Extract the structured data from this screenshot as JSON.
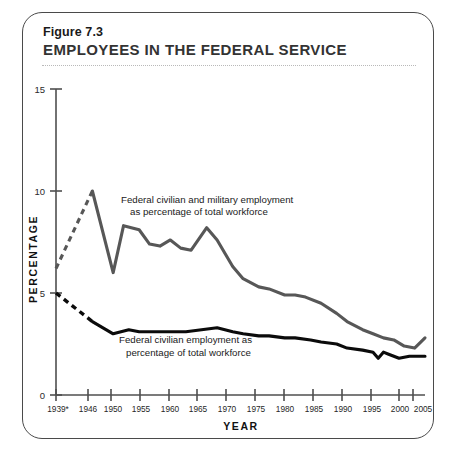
{
  "figure": {
    "number": "Figure 7.3",
    "title": "EMPLOYEES IN THE FEDERAL SERVICE"
  },
  "chart_data": {
    "type": "line",
    "title": "EMPLOYEES IN THE FEDERAL SERVICE",
    "xlabel": "YEAR",
    "ylabel": "PERCENTAGE",
    "xlim": [
      1939,
      2010
    ],
    "ylim": [
      0,
      15
    ],
    "yticks": [
      0,
      5,
      10,
      15
    ],
    "ytick_labels": [
      "0",
      "5",
      "10",
      "15"
    ],
    "xticks": [
      1939,
      1946,
      1950,
      1955,
      1960,
      1965,
      1970,
      1975,
      1980,
      1985,
      1990,
      1995,
      2000,
      2005,
      2010
    ],
    "xtick_labels": [
      "1939*",
      "1946",
      "1950",
      "1955",
      "1960",
      "1965",
      "1970",
      "1975",
      "1980",
      "1985",
      "1990",
      "1995",
      "2000",
      "2005",
      "2010"
    ],
    "grid": false,
    "legend_position": "inline-annotation",
    "colors": {
      "total_employment": "#575757",
      "civilian_employment": "#0b0b0b",
      "axis": "#4f4f4f"
    },
    "series": [
      {
        "name": "Federal civilian and military employment as percentage of total workforce",
        "color": "#575757",
        "dashed_segment_note": "1939-1946 shown dashed (interpolated)",
        "x": [
          1939,
          1946,
          1950,
          1952,
          1955,
          1957,
          1959,
          1961,
          1963,
          1965,
          1968,
          1970,
          1973,
          1975,
          1978,
          1980,
          1983,
          1985,
          1987,
          1990,
          1993,
          1995,
          1998,
          2000,
          2002,
          2004,
          2006,
          2008,
          2010
        ],
        "values": [
          6.2,
          10.0,
          6.0,
          8.3,
          8.1,
          7.4,
          7.3,
          7.6,
          7.2,
          7.1,
          8.2,
          7.6,
          6.3,
          5.7,
          5.3,
          5.2,
          4.9,
          4.9,
          4.8,
          4.5,
          4.0,
          3.6,
          3.2,
          3.0,
          2.8,
          2.7,
          2.4,
          2.3,
          2.8
        ]
      },
      {
        "name": "Federal civilian employment as percentage of total workforce",
        "color": "#0b0b0b",
        "dashed_segment_note": "1939-1946 shown dashed (interpolated)",
        "x": [
          1939,
          1946,
          1950,
          1953,
          1955,
          1958,
          1961,
          1964,
          1967,
          1970,
          1973,
          1975,
          1978,
          1980,
          1983,
          1985,
          1988,
          1990,
          1993,
          1995,
          1998,
          2000,
          2001,
          2002,
          2003,
          2005,
          2007,
          2010
        ],
        "values": [
          5.0,
          3.6,
          3.0,
          3.2,
          3.1,
          3.1,
          3.1,
          3.1,
          3.2,
          3.3,
          3.1,
          3.0,
          2.9,
          2.9,
          2.8,
          2.8,
          2.7,
          2.6,
          2.5,
          2.3,
          2.2,
          2.1,
          1.8,
          2.1,
          2.0,
          1.8,
          1.9,
          1.9
        ]
      }
    ],
    "annotations": [
      {
        "id": "annot-total",
        "lines": [
          "Federal civilian and military employment",
          "as percentage of total workforce"
        ]
      },
      {
        "id": "annot-civilian",
        "lines": [
          "Federal civilian employment as",
          "percentage of total workforce"
        ]
      }
    ]
  }
}
